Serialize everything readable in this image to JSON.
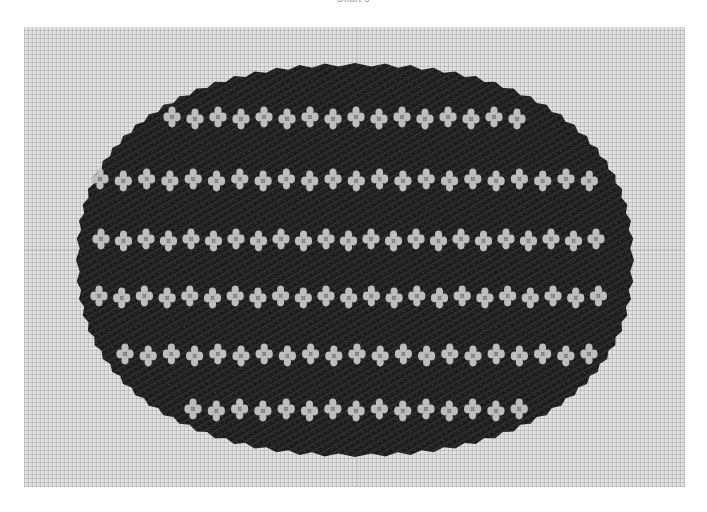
{
  "caption": "Chart 3",
  "image": {
    "subject": "needlepoint-oval-striped-motif",
    "canvas_color": "#dedede",
    "oval_color": "#1e1e1e",
    "motif_color": "#bdbdbd",
    "oval": {
      "cx": 355,
      "cy": 260,
      "rx": 277,
      "ry": 195
    },
    "rows": [
      {
        "y": 118,
        "x_start": 172,
        "count": 16,
        "spacing": 23
      },
      {
        "y": 180,
        "x_start": 100,
        "count": 22,
        "spacing": 23.3
      },
      {
        "y": 240,
        "x_start": 101,
        "count": 23,
        "spacing": 22.5
      },
      {
        "y": 297,
        "x_start": 99,
        "count": 23,
        "spacing": 22.7
      },
      {
        "y": 355,
        "x_start": 125,
        "count": 21,
        "spacing": 23.2
      },
      {
        "y": 410,
        "x_start": 193,
        "count": 15,
        "spacing": 23.3
      }
    ]
  }
}
